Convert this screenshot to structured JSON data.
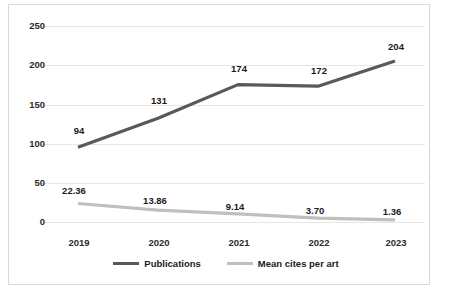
{
  "chart_data": {
    "type": "line",
    "title": "",
    "xlabel": "",
    "ylabel": "",
    "categories": [
      "2019",
      "2020",
      "2021",
      "2022",
      "2023"
    ],
    "yticks": [
      "0",
      "50",
      "100",
      "150",
      "200",
      "250"
    ],
    "ylim": [
      0,
      250
    ],
    "grid": true,
    "legend_position": "bottom",
    "series": [
      {
        "name": "Publications",
        "color": "#595959",
        "values": [
          94,
          131,
          174,
          172,
          204
        ],
        "labels": [
          "94",
          "131",
          "174",
          "172",
          "204"
        ]
      },
      {
        "name": "Mean cites per art",
        "color": "#bfbfbf",
        "values": [
          22.36,
          13.86,
          9.14,
          3.7,
          1.36
        ],
        "labels": [
          "22.36",
          "13.86",
          "9.14",
          "3.70",
          "1.36"
        ]
      }
    ]
  },
  "legend": {
    "items": [
      {
        "label": "Publications"
      },
      {
        "label": "Mean cites per art"
      }
    ]
  }
}
